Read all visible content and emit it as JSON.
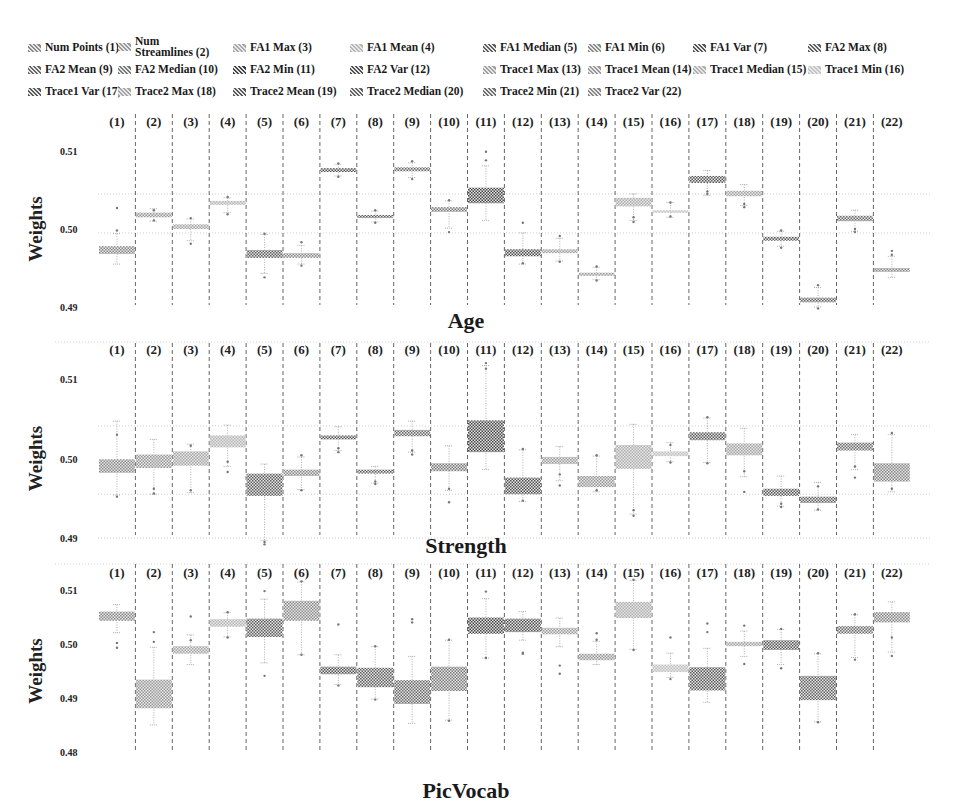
{
  "chart_data": {
    "type": "boxplot",
    "ylabel": "Weights",
    "categories": [
      "(1)",
      "(2)",
      "(3)",
      "(4)",
      "(5)",
      "(6)",
      "(7)",
      "(8)",
      "(9)",
      "(10)",
      "(11)",
      "(12)",
      "(13)",
      "(14)",
      "(15)",
      "(16)",
      "(17)",
      "(18)",
      "(19)",
      "(20)",
      "(21)",
      "(22)"
    ],
    "legend": [
      {
        "label": "Num Points (1)",
        "shade": "#8a8a8a"
      },
      {
        "label": "Num Streamlines (2)",
        "shade": "#9a9a9a"
      },
      {
        "label": "FA1 Max (3)",
        "shade": "#a8a8a8"
      },
      {
        "label": "FA1 Mean (4)",
        "shade": "#b8b8b8"
      },
      {
        "label": "FA1 Median (5)",
        "shade": "#5e5e5e"
      },
      {
        "label": "FA1 Min (6)",
        "shade": "#8c8c8c"
      },
      {
        "label": "FA1 Var (7)",
        "shade": "#555555"
      },
      {
        "label": "FA2 Max (8)",
        "shade": "#606060"
      },
      {
        "label": "FA2 Mean (9)",
        "shade": "#6a6a6a"
      },
      {
        "label": "FA2 Median (10)",
        "shade": "#7a7a7a"
      },
      {
        "label": "FA2 Min (11)",
        "shade": "#444444"
      },
      {
        "label": "FA2 Var (12)",
        "shade": "#505050"
      },
      {
        "label": "Trace1 Max (13)",
        "shade": "#a0a0a0"
      },
      {
        "label": "Trace1 Mean (14)",
        "shade": "#9a9a9a"
      },
      {
        "label": "Trace1 Median (15)",
        "shade": "#b0b0b0"
      },
      {
        "label": "Trace1 Min (16)",
        "shade": "#c4c4c4"
      },
      {
        "label": "Trace1 Var (17)",
        "shade": "#5a5a5a"
      },
      {
        "label": "Trace2 Max (18)",
        "shade": "#a6a6a6"
      },
      {
        "label": "Trace2 Mean (19)",
        "shade": "#585858"
      },
      {
        "label": "Trace2 Median (20)",
        "shade": "#646464"
      },
      {
        "label": "Trace2 Min (21)",
        "shade": "#6e6e6e"
      },
      {
        "label": "Trace2 Var (22)",
        "shade": "#888888"
      }
    ],
    "panels": [
      {
        "title": "Age",
        "yticks": [
          0.51,
          0.5,
          0.49
        ],
        "ytick_labels": [
          "0.51",
          "0.50",
          "0.49"
        ],
        "ylim": [
          0.4895,
          0.5125
        ],
        "grid": [
          0.5045,
          0.4995
        ],
        "boxes": [
          {
            "q1": 0.4968,
            "q3": 0.4978,
            "lo": 0.4955,
            "hi": 0.4994,
            "fliers": [
              0.5027,
              0.4998
            ]
          },
          {
            "q1": 0.5015,
            "q3": 0.5021,
            "lo": 0.501,
            "hi": 0.5026,
            "fliers": [
              0.5024,
              0.5011
            ]
          },
          {
            "q1": 0.5,
            "q3": 0.5006,
            "lo": 0.4985,
            "hi": 0.5013,
            "fliers": [
              0.5014,
              0.4981
            ]
          },
          {
            "q1": 0.5031,
            "q3": 0.5036,
            "lo": 0.5021,
            "hi": 0.504,
            "fliers": [
              0.5041,
              0.5019
            ]
          },
          {
            "q1": 0.4963,
            "q3": 0.4973,
            "lo": 0.4943,
            "hi": 0.4993,
            "fliers": [
              0.4994,
              0.4938
            ]
          },
          {
            "q1": 0.4963,
            "q3": 0.4969,
            "lo": 0.4955,
            "hi": 0.4979,
            "fliers": [
              0.4983,
              0.4953
            ]
          },
          {
            "q1": 0.5073,
            "q3": 0.5078,
            "lo": 0.5068,
            "hi": 0.5083,
            "fliers": [
              0.5084,
              0.5067
            ]
          },
          {
            "q1": 0.5014,
            "q3": 0.5018,
            "lo": 0.5009,
            "hi": 0.5023,
            "fliers": [
              0.5024,
              0.5008
            ]
          },
          {
            "q1": 0.5074,
            "q3": 0.5079,
            "lo": 0.5066,
            "hi": 0.5085,
            "fliers": [
              0.5087,
              0.5064
            ]
          },
          {
            "q1": 0.5022,
            "q3": 0.5028,
            "lo": 0.5001,
            "hi": 0.5036,
            "fliers": [
              0.5037,
              0.4996
            ]
          },
          {
            "q1": 0.5033,
            "q3": 0.5053,
            "lo": 0.5011,
            "hi": 0.5081,
            "fliers": [
              0.5099,
              0.5088
            ]
          },
          {
            "q1": 0.4965,
            "q3": 0.4974,
            "lo": 0.4955,
            "hi": 0.4995,
            "fliers": [
              0.5008,
              0.4956
            ]
          },
          {
            "q1": 0.4969,
            "q3": 0.4974,
            "lo": 0.4959,
            "hi": 0.4988,
            "fliers": [
              0.4991,
              0.4958
            ]
          },
          {
            "q1": 0.494,
            "q3": 0.4944,
            "lo": 0.4935,
            "hi": 0.4951,
            "fliers": [
              0.4952,
              0.4934
            ]
          },
          {
            "q1": 0.5029,
            "q3": 0.504,
            "lo": 0.5011,
            "hi": 0.5045,
            "fliers": [
              0.5015,
              0.5009
            ]
          },
          {
            "q1": 0.5021,
            "q3": 0.5024,
            "lo": 0.5015,
            "hi": 0.5034,
            "fliers": [
              0.5034,
              0.5016
            ]
          },
          {
            "q1": 0.5059,
            "q3": 0.5068,
            "lo": 0.5043,
            "hi": 0.5075,
            "fliers": [
              0.5048,
              0.5045
            ]
          },
          {
            "q1": 0.5042,
            "q3": 0.5049,
            "lo": 0.503,
            "hi": 0.5057,
            "fliers": [
              0.5032,
              0.5028
            ]
          },
          {
            "q1": 0.4985,
            "q3": 0.499,
            "lo": 0.4978,
            "hi": 0.4997,
            "fliers": [
              0.4998,
              0.4976
            ]
          },
          {
            "q1": 0.4906,
            "q3": 0.4912,
            "lo": 0.49,
            "hi": 0.4925,
            "fliers": [
              0.4928,
              0.4898
            ]
          },
          {
            "q1": 0.501,
            "q3": 0.5017,
            "lo": 0.4997,
            "hi": 0.5024,
            "fliers": [
              0.5,
              0.4996
            ]
          },
          {
            "q1": 0.4945,
            "q3": 0.495,
            "lo": 0.4938,
            "hi": 0.4965,
            "fliers": [
              0.4972,
              0.4967
            ]
          }
        ]
      },
      {
        "title": "Strength",
        "yticks": [
          0.51,
          0.5,
          0.49
        ],
        "ytick_labels": [
          "0.51",
          "0.50",
          "0.49"
        ],
        "ylim": [
          0.4885,
          0.513
        ],
        "grid": [
          0.5041,
          0.4955,
          0.49
        ],
        "boxes": [
          {
            "q1": 0.4982,
            "q3": 0.4999,
            "lo": 0.4954,
            "hi": 0.5047,
            "fliers": [
              0.503,
              0.4952
            ]
          },
          {
            "q1": 0.4988,
            "q3": 0.5005,
            "lo": 0.4955,
            "hi": 0.5024,
            "fliers": [
              0.4962,
              0.4956
            ]
          },
          {
            "q1": 0.4991,
            "q3": 0.5009,
            "lo": 0.4957,
            "hi": 0.5018,
            "fliers": [
              0.5016,
              0.496
            ]
          },
          {
            "q1": 0.5014,
            "q3": 0.5029,
            "lo": 0.499,
            "hi": 0.5042,
            "fliers": [
              0.4996,
              0.4983
            ]
          },
          {
            "q1": 0.4953,
            "q3": 0.4981,
            "lo": 0.4897,
            "hi": 0.4993,
            "fliers": [
              0.4895,
              0.4892
            ]
          },
          {
            "q1": 0.4978,
            "q3": 0.4986,
            "lo": 0.4961,
            "hi": 0.5002,
            "fliers": [
              0.5004,
              0.496
            ]
          },
          {
            "q1": 0.5024,
            "q3": 0.5029,
            "lo": 0.501,
            "hi": 0.504,
            "fliers": [
              0.5013,
              0.5008
            ]
          },
          {
            "q1": 0.4981,
            "q3": 0.4986,
            "lo": 0.4969,
            "hi": 0.499,
            "fliers": [
              0.4971,
              0.4968
            ]
          },
          {
            "q1": 0.5028,
            "q3": 0.5036,
            "lo": 0.5008,
            "hi": 0.5047,
            "fliers": [
              0.501,
              0.5005
            ]
          },
          {
            "q1": 0.4984,
            "q3": 0.4994,
            "lo": 0.496,
            "hi": 0.5016,
            "fliers": [
              0.4962,
              0.4945
            ]
          },
          {
            "q1": 0.5008,
            "q3": 0.5048,
            "lo": 0.4986,
            "hi": 0.5117,
            "fliers": [
              0.512,
              0.5113
            ]
          },
          {
            "q1": 0.4955,
            "q3": 0.4976,
            "lo": 0.4946,
            "hi": 0.5011,
            "fliers": [
              0.5012,
              0.4947
            ]
          },
          {
            "q1": 0.4993,
            "q3": 0.5002,
            "lo": 0.4972,
            "hi": 0.5015,
            "fliers": [
              0.498,
              0.4966
            ]
          },
          {
            "q1": 0.4964,
            "q3": 0.4978,
            "lo": 0.4958,
            "hi": 0.5003,
            "fliers": [
              0.5004,
              0.496
            ]
          },
          {
            "q1": 0.4987,
            "q3": 0.5017,
            "lo": 0.493,
            "hi": 0.5043,
            "fliers": [
              0.4935,
              0.4928
            ]
          },
          {
            "q1": 0.5003,
            "q3": 0.5009,
            "lo": 0.4996,
            "hi": 0.502,
            "fliers": [
              0.5017,
              0.4995
            ]
          },
          {
            "q1": 0.5023,
            "q3": 0.5033,
            "lo": 0.4995,
            "hi": 0.5051,
            "fliers": [
              0.5052,
              0.4994
            ]
          },
          {
            "q1": 0.5004,
            "q3": 0.5019,
            "lo": 0.4977,
            "hi": 0.5038,
            "fliers": [
              0.4984,
              0.4958
            ]
          },
          {
            "q1": 0.4953,
            "q3": 0.4962,
            "lo": 0.494,
            "hi": 0.4978,
            "fliers": [
              0.4943,
              0.4939
            ]
          },
          {
            "q1": 0.4944,
            "q3": 0.4952,
            "lo": 0.4935,
            "hi": 0.497,
            "fliers": [
              0.4965,
              0.4936
            ]
          },
          {
            "q1": 0.501,
            "q3": 0.502,
            "lo": 0.4986,
            "hi": 0.503,
            "fliers": [
              0.499,
              0.4976
            ]
          },
          {
            "q1": 0.4971,
            "q3": 0.4994,
            "lo": 0.4958,
            "hi": 0.503,
            "fliers": [
              0.5032,
              0.4962
            ]
          }
        ]
      },
      {
        "title": "PicVocab",
        "yticks": [
          0.51,
          0.5,
          0.49,
          0.48
        ],
        "ytick_labels": [
          "0.51",
          "0.50",
          "0.49",
          "0.48"
        ],
        "ylim": [
          0.4795,
          0.513
        ],
        "grid": [],
        "boxes": [
          {
            "q1": 0.5043,
            "q3": 0.506,
            "lo": 0.5021,
            "hi": 0.5073,
            "fliers": [
              0.5002,
              0.4993
            ]
          },
          {
            "q1": 0.4881,
            "q3": 0.4934,
            "lo": 0.485,
            "hi": 0.4994,
            "fliers": [
              0.5022,
              0.5004
            ]
          },
          {
            "q1": 0.4982,
            "q3": 0.4996,
            "lo": 0.4962,
            "hi": 0.5017,
            "fliers": [
              0.5051,
              0.5007
            ]
          },
          {
            "q1": 0.5032,
            "q3": 0.5046,
            "lo": 0.5013,
            "hi": 0.5058,
            "fliers": [
              0.5059,
              0.5012
            ]
          },
          {
            "q1": 0.5013,
            "q3": 0.5047,
            "lo": 0.4965,
            "hi": 0.5083,
            "fliers": [
              0.5098,
              0.4941
            ]
          },
          {
            "q1": 0.5043,
            "q3": 0.508,
            "lo": 0.498,
            "hi": 0.5115,
            "fliers": [
              0.5116,
              0.498
            ]
          },
          {
            "q1": 0.4944,
            "q3": 0.4958,
            "lo": 0.4925,
            "hi": 0.498,
            "fliers": [
              0.5036,
              0.4923
            ]
          },
          {
            "q1": 0.492,
            "q3": 0.4956,
            "lo": 0.4898,
            "hi": 0.4995,
            "fliers": [
              0.4996,
              0.4897
            ]
          },
          {
            "q1": 0.4889,
            "q3": 0.4933,
            "lo": 0.4853,
            "hi": 0.4977,
            "fliers": [
              0.5046,
              0.504
            ]
          },
          {
            "q1": 0.4913,
            "q3": 0.4958,
            "lo": 0.4859,
            "hi": 0.5007,
            "fliers": [
              0.5008,
              0.4858
            ]
          },
          {
            "q1": 0.5019,
            "q3": 0.5049,
            "lo": 0.4974,
            "hi": 0.5084,
            "fliers": [
              0.5097,
              0.4974
            ]
          },
          {
            "q1": 0.5022,
            "q3": 0.5047,
            "lo": 0.5007,
            "hi": 0.506,
            "fliers": [
              0.4984,
              0.4982
            ]
          },
          {
            "q1": 0.5018,
            "q3": 0.503,
            "lo": 0.4995,
            "hi": 0.5048,
            "fliers": [
              0.496,
              0.4945
            ]
          },
          {
            "q1": 0.497,
            "q3": 0.4982,
            "lo": 0.4962,
            "hi": 0.5005,
            "fliers": [
              0.502,
              0.5008
            ]
          },
          {
            "q1": 0.5048,
            "q3": 0.5078,
            "lo": 0.499,
            "hi": 0.5118,
            "fliers": [
              0.5119,
              0.4989
            ]
          },
          {
            "q1": 0.4948,
            "q3": 0.4962,
            "lo": 0.4938,
            "hi": 0.4983,
            "fliers": [
              0.5012,
              0.4935
            ]
          },
          {
            "q1": 0.4914,
            "q3": 0.4957,
            "lo": 0.4892,
            "hi": 0.4992,
            "fliers": [
              0.5038,
              0.5022
            ]
          },
          {
            "q1": 0.4996,
            "q3": 0.5004,
            "lo": 0.4977,
            "hi": 0.5024,
            "fliers": [
              0.5034,
              0.4963
            ]
          },
          {
            "q1": 0.4989,
            "q3": 0.5007,
            "lo": 0.4962,
            "hi": 0.5027,
            "fliers": [
              0.5028,
              0.4955
            ]
          },
          {
            "q1": 0.4896,
            "q3": 0.4941,
            "lo": 0.4856,
            "hi": 0.4982,
            "fliers": [
              0.4983,
              0.4855
            ]
          },
          {
            "q1": 0.5019,
            "q3": 0.5033,
            "lo": 0.4975,
            "hi": 0.5054,
            "fliers": [
              0.5055,
              0.4971
            ]
          },
          {
            "q1": 0.504,
            "q3": 0.5059,
            "lo": 0.4985,
            "hi": 0.5078,
            "fliers": [
              0.5012,
              0.4978
            ]
          }
        ]
      }
    ]
  }
}
